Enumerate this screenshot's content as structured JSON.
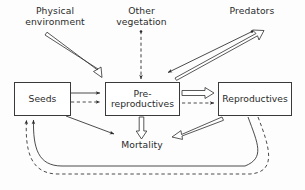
{
  "diagram": {
    "background": "#fdfdfd",
    "stroke": "#3a3a3a",
    "text_color": "#2b2b2b",
    "nodes": [
      {
        "id": "seeds",
        "label": "Seeds",
        "x": 14,
        "y": 82,
        "w": 57,
        "h": 34
      },
      {
        "id": "prereproductives",
        "label_line1": "Pre-",
        "label_line2": "reproductives",
        "x": 105,
        "y": 82,
        "w": 75,
        "h": 34
      },
      {
        "id": "reproductives",
        "label": "Reproductives",
        "x": 218,
        "y": 82,
        "w": 74,
        "h": 34
      }
    ],
    "labels": [
      {
        "id": "physical-environment",
        "line1": "Physical",
        "line2": "environment",
        "x": 22,
        "y": 6
      },
      {
        "id": "other-vegetation",
        "line1": "Other",
        "line2": "vegetation",
        "x": 118,
        "y": 6
      },
      {
        "id": "predators",
        "line1": "Predators",
        "line2": "",
        "x": 224,
        "y": 6
      },
      {
        "id": "mortality",
        "line1": "Mortality",
        "line2": "",
        "x": 121,
        "y": 140
      }
    ],
    "edges": [
      {
        "id": "physical-env-to-prereproductives",
        "style": "hollow",
        "from": "physical-environment",
        "to": "prereproductives"
      },
      {
        "id": "other-vegetation-to-prereproductives",
        "style": "dashed",
        "from": "other-vegetation",
        "to": "prereproductives"
      },
      {
        "id": "prereproductives-to-predators",
        "style": "hollow",
        "from": "prereproductives",
        "to": "predators"
      },
      {
        "id": "predators-to-prereproductives",
        "style": "solid-thin",
        "from": "predators",
        "to": "prereproductives"
      },
      {
        "id": "seeds-to-prereproductives-solid",
        "style": "solid-thin",
        "from": "seeds",
        "to": "prereproductives"
      },
      {
        "id": "seeds-to-prereproductives-dashed",
        "style": "dashed",
        "from": "seeds",
        "to": "prereproductives"
      },
      {
        "id": "seeds-to-mortality",
        "style": "solid-thin",
        "from": "seeds",
        "to": "mortality"
      },
      {
        "id": "prereproductives-to-mortality",
        "style": "hollow",
        "from": "prereproductives",
        "to": "mortality"
      },
      {
        "id": "prereproductives-to-reproductives-hollow",
        "style": "hollow",
        "from": "prereproductives",
        "to": "reproductives"
      },
      {
        "id": "prereproductives-to-reproductives-dashed",
        "style": "dashed",
        "from": "prereproductives",
        "to": "reproductives"
      },
      {
        "id": "reproductives-to-mortality",
        "style": "hollow",
        "from": "reproductives",
        "to": "mortality"
      },
      {
        "id": "reproductives-to-seeds-solid",
        "style": "solid-curve",
        "from": "reproductives",
        "to": "seeds"
      },
      {
        "id": "reproductives-to-seeds-dashed",
        "style": "dashed-curve",
        "from": "reproductives",
        "to": "seeds"
      }
    ]
  }
}
